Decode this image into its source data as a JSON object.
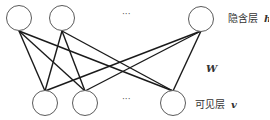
{
  "diagram": {
    "type": "bipartite-network",
    "hidden_layer": {
      "label": "隐含层",
      "symbol": "h",
      "nodes": [
        {
          "id": "h1",
          "cx": 19,
          "cy": 18
        },
        {
          "id": "h2",
          "cx": 62,
          "cy": 18
        },
        {
          "id": "hn",
          "cx": 201,
          "cy": 19
        }
      ],
      "ellipsis": "···"
    },
    "visible_layer": {
      "label": "可见层",
      "symbol": "v",
      "nodes": [
        {
          "id": "v1",
          "cx": 45,
          "cy": 103
        },
        {
          "id": "v2",
          "cx": 85,
          "cy": 103
        },
        {
          "id": "vn",
          "cx": 173,
          "cy": 103
        }
      ],
      "ellipsis": "···"
    },
    "weights_label": "W",
    "edges": [
      [
        "h1",
        "v1"
      ],
      [
        "h1",
        "v2"
      ],
      [
        "h1",
        "vn"
      ],
      [
        "h2",
        "v1"
      ],
      [
        "h2",
        "v2"
      ],
      [
        "h2",
        "vn"
      ],
      [
        "hn",
        "v1"
      ],
      [
        "hn",
        "v2"
      ],
      [
        "hn",
        "vn"
      ]
    ]
  }
}
